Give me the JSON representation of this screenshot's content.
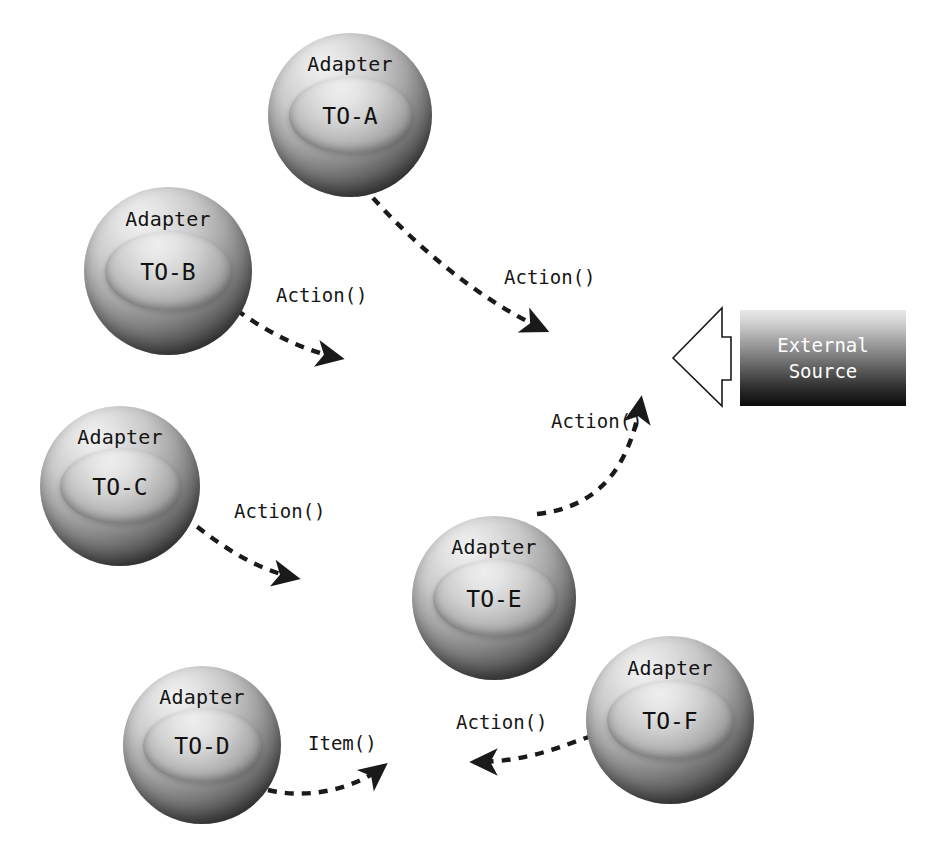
{
  "diagram": {
    "background_color": "#ffffff",
    "nodes": [
      {
        "id": "to-a",
        "title": "Adapter",
        "name": "TO-A",
        "x": 268,
        "y": 33,
        "size": 164
      },
      {
        "id": "to-b",
        "title": "Adapter",
        "name": "TO-B",
        "x": 84,
        "y": 187,
        "size": 168
      },
      {
        "id": "to-c",
        "title": "Adapter",
        "name": "TO-C",
        "x": 40,
        "y": 406,
        "size": 160
      },
      {
        "id": "to-d",
        "title": "Adapter",
        "name": "TO-D",
        "x": 123,
        "y": 666,
        "size": 158
      },
      {
        "id": "to-e",
        "title": "Adapter",
        "name": "TO-E",
        "x": 412,
        "y": 516,
        "size": 164
      },
      {
        "id": "to-f",
        "title": "Adapter",
        "name": "TO-F",
        "x": 586,
        "y": 636,
        "size": 168
      }
    ],
    "external_source": {
      "line1": "External",
      "line2": "Source",
      "x": 740,
      "y": 310,
      "width": 166,
      "height": 96,
      "text_color": "#ffffff",
      "gradient_top": "#e9e9e9",
      "gradient_bottom": "#0a0a0a"
    },
    "block_arrow": {
      "direction": "left",
      "fill": "#ffffff",
      "stroke": "#1a1a1a"
    },
    "edges": [
      {
        "id": "edge-a-src",
        "from": "to-a",
        "to": "external-source",
        "label": "Action()",
        "label_x": 504,
        "label_y": 268,
        "style": "dashed",
        "arrow_at": "end"
      },
      {
        "id": "edge-b-right",
        "from": "to-b",
        "to": "external-source",
        "label": "Action()",
        "label_x": 276,
        "label_y": 286,
        "style": "dashed",
        "arrow_at": "end"
      },
      {
        "id": "edge-c-right",
        "from": "to-c",
        "to": "external-source",
        "label": "Action()",
        "label_x": 234,
        "label_y": 502,
        "style": "dashed",
        "arrow_at": "end"
      },
      {
        "id": "edge-e-src",
        "from": "to-e",
        "to": "external-source",
        "label": "Action()",
        "label_x": 551,
        "label_y": 412,
        "style": "dashed",
        "arrow_at": "end"
      },
      {
        "id": "edge-d-item",
        "from": "to-d",
        "to": "to-e",
        "label": "Item()",
        "label_x": 308,
        "label_y": 734,
        "style": "dashed",
        "arrow_at": "end"
      },
      {
        "id": "edge-f-e",
        "from": "to-f",
        "to": "to-e",
        "label": "Action()",
        "label_x": 456,
        "label_y": 713,
        "style": "dashed",
        "arrow_at": "end"
      }
    ],
    "stroke_color": "#1a1a1a",
    "dash_pattern": "9 8"
  }
}
